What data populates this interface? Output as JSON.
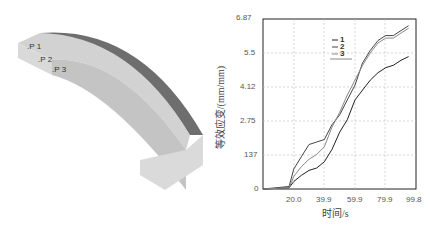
{
  "model": {
    "points": [
      ".P 1",
      ".P 2",
      ".P 3"
    ]
  },
  "chart_data": {
    "type": "line",
    "title": "",
    "xlabel": "时间/s",
    "ylabel": "等效应变/(mm/mm)",
    "x_ticks": [
      "20.0",
      "39.9",
      "59.9",
      "79.9",
      "99.8"
    ],
    "y_ticks": [
      "0",
      "137",
      "2.75",
      "4.12",
      "5.5",
      "6.87"
    ],
    "xlim": [
      0,
      99.8
    ],
    "ylim": [
      0,
      6.87
    ],
    "grid": true,
    "legend": [
      "1",
      "2",
      "3"
    ],
    "series": [
      {
        "name": "1",
        "x": [
          0,
          17,
          20,
          25,
          30,
          35,
          40,
          45,
          50,
          55,
          60,
          65,
          70,
          75,
          80,
          85,
          90,
          95
        ],
        "y": [
          0,
          0.05,
          0.3,
          0.55,
          0.75,
          0.85,
          1.1,
          1.6,
          2.3,
          2.8,
          3.6,
          4.0,
          4.4,
          4.7,
          4.9,
          5.0,
          5.2,
          5.35
        ]
      },
      {
        "name": "2",
        "x": [
          0,
          17,
          20,
          25,
          30,
          35,
          40,
          45,
          50,
          55,
          60,
          65,
          70,
          75,
          80,
          85,
          90,
          95
        ],
        "y": [
          0,
          0.1,
          0.8,
          1.3,
          1.8,
          1.9,
          2.0,
          2.6,
          3.0,
          3.6,
          4.2,
          5.1,
          5.6,
          6.0,
          6.2,
          6.2,
          6.4,
          6.6
        ]
      },
      {
        "name": "3",
        "x": [
          0,
          17,
          20,
          25,
          30,
          35,
          40,
          45,
          50,
          55,
          60,
          65,
          70,
          75,
          80,
          85,
          90,
          95
        ],
        "y": [
          0,
          0.05,
          0.5,
          0.9,
          1.2,
          1.4,
          1.7,
          2.5,
          3.1,
          3.8,
          4.4,
          5.0,
          5.5,
          5.9,
          6.1,
          6.1,
          6.3,
          6.5
        ]
      }
    ]
  },
  "colors": {
    "line1": "#222222",
    "line2": "#444444",
    "line3": "#888888",
    "band": "#6e6e6e",
    "face": "#cfcfcf"
  }
}
